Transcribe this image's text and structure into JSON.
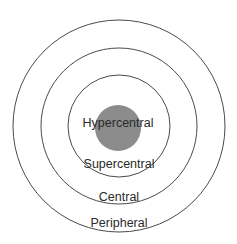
{
  "diagram": {
    "type": "concentric-circles",
    "colors": {
      "ring_stroke": "#4a4a4a",
      "core_fill": "#8c8c8c",
      "label": "#2a2a2a",
      "background": "#ffffff"
    },
    "rings": [
      {
        "name": "peripheral",
        "label": "Peripheral"
      },
      {
        "name": "central",
        "label": "Central"
      },
      {
        "name": "supercentral",
        "label": "Supercentral"
      },
      {
        "name": "hypercentral",
        "label": "Hypercentral"
      }
    ]
  }
}
